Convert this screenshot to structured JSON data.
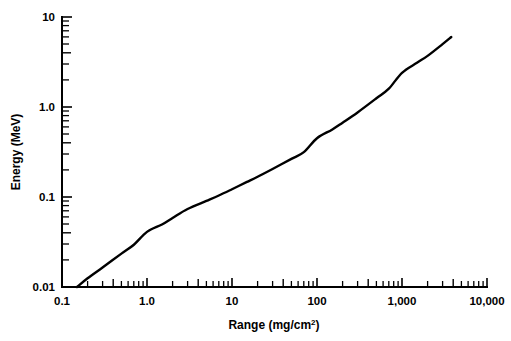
{
  "chart_data": {
    "type": "line",
    "title": "",
    "xlabel": "Range (mg/cm2)",
    "xlabel_base": "Range (mg/cm",
    "xlabel_sup": "2",
    "xlabel_close": ")",
    "ylabel": "Energy (MeV)",
    "xscale": "log",
    "yscale": "log",
    "xlim": [
      0.1,
      10000
    ],
    "ylim": [
      0.01,
      10
    ],
    "grid": false,
    "legend": null,
    "xticks": [
      0.1,
      1.0,
      10,
      100,
      1000,
      10000
    ],
    "xtick_labels": [
      "0.1",
      "1.0",
      "10",
      "100",
      "1,000",
      "10,000"
    ],
    "yticks": [
      0.01,
      0.1,
      1.0,
      10
    ],
    "ytick_labels": [
      "0.01",
      "0.1",
      "1.0",
      "10"
    ],
    "series": [
      {
        "name": "Range-energy curve",
        "x": [
          0.15,
          0.2,
          0.3,
          0.5,
          0.7,
          1.0,
          1.5,
          2.0,
          3.0,
          5.0,
          7.0,
          10,
          15,
          20,
          30,
          50,
          70,
          100,
          150,
          200,
          300,
          500,
          700,
          1000,
          1500,
          2000,
          3000,
          3800
        ],
        "y": [
          0.01,
          0.0125,
          0.0165,
          0.0235,
          0.0295,
          0.041,
          0.0495,
          0.0585,
          0.0735,
          0.0905,
          0.104,
          0.122,
          0.147,
          0.168,
          0.205,
          0.265,
          0.315,
          0.45,
          0.56,
          0.67,
          0.87,
          1.25,
          1.6,
          2.4,
          3.1,
          3.7,
          5.0,
          6.0
        ]
      }
    ]
  },
  "axes": {
    "x_tick_labels": [
      "0.1",
      "1.0",
      "10",
      "100",
      "1,000",
      "10,000"
    ],
    "y_tick_labels": [
      "10",
      "1.0",
      "0.1",
      "0.01"
    ],
    "x_title_base": "Range (mg/cm",
    "x_title_sup": "2",
    "x_title_close": ")",
    "y_title": "Energy (MeV)"
  },
  "colors": {
    "background": "#ffffff",
    "axis": "#000000",
    "curve": "#000000",
    "text": "#000000"
  }
}
